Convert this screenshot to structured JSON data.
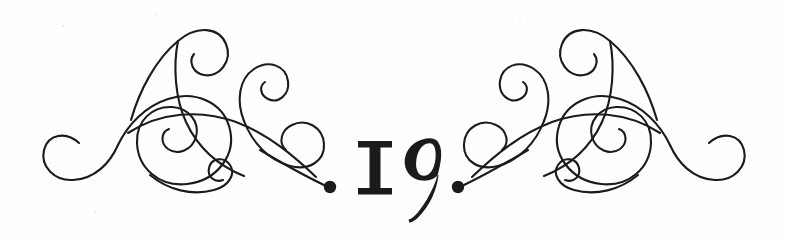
{
  "page": {
    "kind": "decorative-page-number-ornament",
    "width": 788,
    "height": 237,
    "background_color": "#fefefe",
    "ink_color": "#1c1a1a"
  },
  "page_number": {
    "value": "19",
    "digit_one": "1",
    "digit_nine": "9",
    "style": "old-style-figures",
    "description": "Roman-style I with slab serifs followed by an old-style 9 with descender"
  },
  "ornament": {
    "left_label": "left-flourish",
    "right_label": "right-flourish",
    "symmetry": "mirrored",
    "terminal_left_label": "left-terminal-dot",
    "terminal_right_label": "right-terminal-dot"
  }
}
